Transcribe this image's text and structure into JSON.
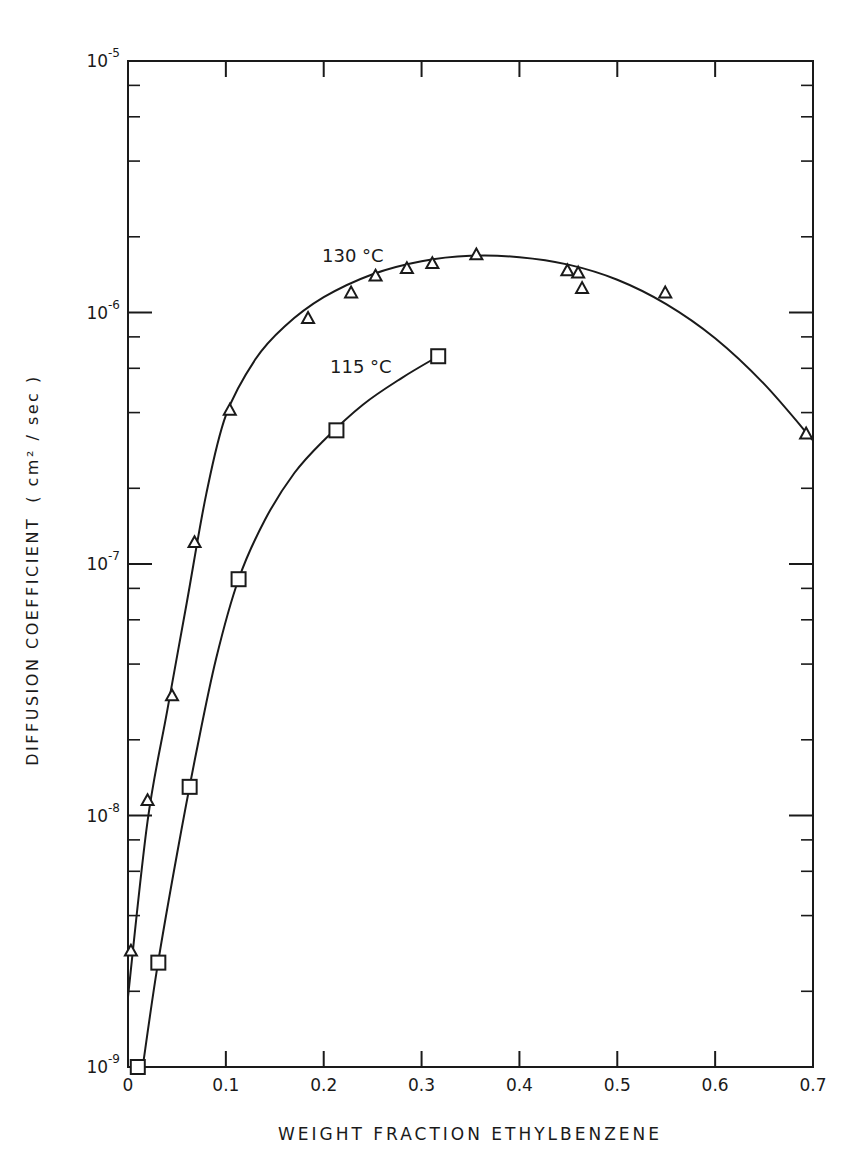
{
  "chart_data": {
    "type": "scatter",
    "title": "",
    "xlabel": "WEIGHT FRACTION ETHYLBENZENE",
    "ylabel": "DIFFUSION COEFFICIENT ( cm² / sec )",
    "xlim": [
      0,
      0.7
    ],
    "ylim": [
      1e-09,
      1e-05
    ],
    "yscale": "log",
    "grid": false,
    "legend_position": "inline annotations",
    "x_ticks": [
      "0",
      "0.1",
      "0.2",
      "0.3",
      "0.4",
      "0.5",
      "0.6",
      "0.7"
    ],
    "y_ticks": [
      "10⁻⁹",
      "10⁻⁸",
      "10⁻⁷",
      "10⁻⁶",
      "10⁻⁵"
    ],
    "series": [
      {
        "name": "130 °C",
        "marker": "triangle",
        "x": [
          0.003,
          0.02,
          0.045,
          0.068,
          0.104,
          0.184,
          0.228,
          0.253,
          0.285,
          0.311,
          0.356,
          0.449,
          0.46,
          0.464,
          0.549,
          0.693
        ],
        "y": [
          2.9e-09,
          1.15e-08,
          3e-08,
          1.22e-07,
          4.1e-07,
          9.5e-07,
          1.2e-06,
          1.4e-06,
          1.5e-06,
          1.57e-06,
          1.7e-06,
          1.47e-06,
          1.44e-06,
          1.25e-06,
          1.2e-06,
          3.3e-07
        ],
        "curve": {
          "x": [
            0.0,
            0.02,
            0.04,
            0.06,
            0.08,
            0.1,
            0.13,
            0.16,
            0.2,
            0.25,
            0.3,
            0.35,
            0.4,
            0.45,
            0.5,
            0.55,
            0.6,
            0.65,
            0.7
          ],
          "y": [
            1.9e-09,
            9.5e-09,
            2.6e-08,
            7e-08,
            1.9e-07,
            3.9e-07,
            6.5e-07,
            8.8e-07,
            1.15e-06,
            1.42e-06,
            1.6e-06,
            1.68e-06,
            1.66e-06,
            1.55e-06,
            1.35e-06,
            1.08e-06,
            7.9e-07,
            5.2e-07,
            3.1e-07
          ]
        }
      },
      {
        "name": "115 °C",
        "marker": "square",
        "x": [
          0.01,
          0.031,
          0.063,
          0.113,
          0.213,
          0.317
        ],
        "y": [
          1e-09,
          2.6e-09,
          1.3e-08,
          8.7e-08,
          3.4e-07,
          6.7e-07
        ],
        "curve": {
          "x": [
            0.015,
            0.03,
            0.05,
            0.07,
            0.09,
            0.113,
            0.14,
            0.17,
            0.2,
            0.24,
            0.28,
            0.317
          ],
          "y": [
            1e-09,
            2.5e-09,
            7e-09,
            1.8e-08,
            4.2e-08,
            8.7e-08,
            1.5e-07,
            2.3e-07,
            3.1e-07,
            4.3e-07,
            5.5e-07,
            6.7e-07
          ]
        }
      }
    ],
    "annotations": [
      {
        "text": "130 °C",
        "x": 0.2,
        "y": 1.9e-06
      },
      {
        "text": "115 °C",
        "x": 0.205,
        "y": 6e-07
      }
    ]
  },
  "labels": {
    "xlabel": "WEIGHT FRACTION ETHYLBENZENE",
    "ylabel_main": "DIFFUSION COEFFICIENT",
    "ylabel_units": "( cm² / sec )",
    "series_130": "130 °C",
    "series_115": "115 °C"
  }
}
